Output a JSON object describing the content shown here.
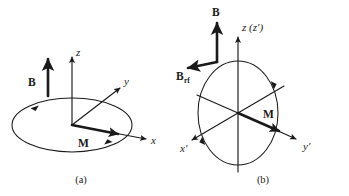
{
  "figure": {
    "background_color": "#ffffff",
    "ink_color": "#1a1a1a"
  },
  "panel_a": {
    "caption": "(a)",
    "labels": {
      "field_vector": "B",
      "magnetization_vector": "M",
      "axis_z": "z",
      "axis_y": "y",
      "axis_x": "x"
    }
  },
  "panel_b": {
    "caption": "(b)",
    "labels": {
      "field_vector": "B",
      "rf_field_vector": "B",
      "rf_field_subscript": "rf",
      "magnetization_vector": "M",
      "axis_z": "z (z′)",
      "axis_x_prime": "x′",
      "axis_y_prime": "y′"
    }
  }
}
